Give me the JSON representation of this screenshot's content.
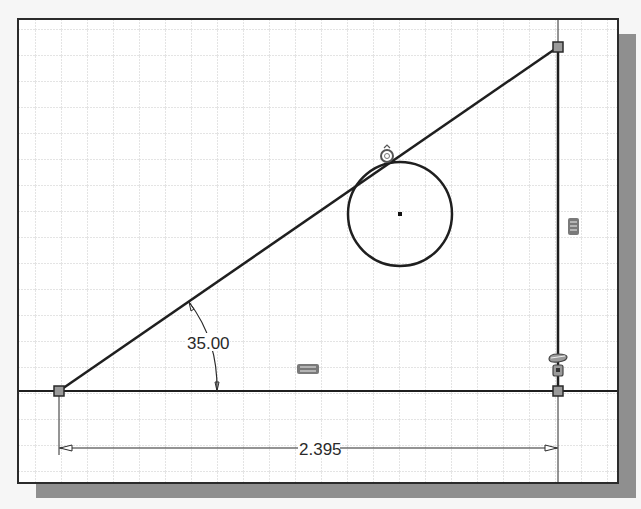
{
  "sketch": {
    "frame": {
      "x": 18,
      "y": 19,
      "width": 600,
      "height": 464
    },
    "shadow_color": "#8f8f8f",
    "grid": {
      "spacing": 26,
      "offset_x": 9,
      "offset_y": 3,
      "color": "#c9c9c9"
    },
    "line_color": "#1f1f1f",
    "points": {
      "bottom_left": {
        "x": 59,
        "y": 391
      },
      "bottom_right": {
        "x": 558,
        "y": 391
      },
      "top_right": {
        "x": 558,
        "y": 47
      }
    },
    "circle": {
      "cx": 400,
      "cy": 214,
      "r": 52
    },
    "dimensions": {
      "angle": {
        "label": "35.00",
        "units": "deg"
      },
      "linear": {
        "label": "2.395"
      }
    },
    "constraints": [
      {
        "type": "tangent",
        "icon": "tangent-icon",
        "x": 387,
        "y": 155
      },
      {
        "type": "vertical",
        "icon": "vertical-constraint-icon",
        "x": 574,
        "y": 227
      },
      {
        "type": "horizontal",
        "icon": "horizontal-constraint-icon",
        "x": 308,
        "y": 369
      },
      {
        "type": "perpendicular",
        "icon": "perpendicular-constraint-icon",
        "x": 558,
        "y": 360
      },
      {
        "type": "coincident",
        "icon": "coincident-constraint-icon",
        "x": 558,
        "y": 372
      }
    ]
  }
}
